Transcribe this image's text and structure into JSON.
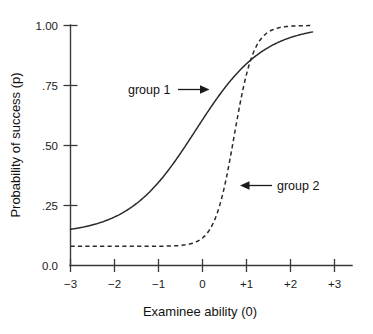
{
  "figure": {
    "width": 373,
    "height": 334,
    "background": "#ffffff",
    "ink_color": "#2a2a2a"
  },
  "chart_data": {
    "type": "line",
    "title": "",
    "subtitle": "",
    "xlabel": "Examinee ability (0)",
    "ylabel": "Probability of success (p)",
    "xlim": [
      -3.3,
      3.3
    ],
    "ylim": [
      0.0,
      1.0
    ],
    "xticks": [
      -3,
      -2,
      -1,
      0,
      1,
      2,
      3
    ],
    "xticklabels": [
      "−3",
      "−2",
      "−1",
      "0",
      "+1",
      "+2",
      "+3"
    ],
    "yticks": [
      0.0,
      0.25,
      0.5,
      0.75,
      1.0
    ],
    "yticklabels": [
      "0.0",
      ".25",
      ".50",
      ".75",
      "1.00"
    ],
    "grid": false,
    "legend": "none",
    "annotations": [
      {
        "text": "group 1",
        "series": "group 1",
        "arrow_direction": "right",
        "points_at_x": -0.05,
        "points_at_y": 0.73
      },
      {
        "text": "group 2",
        "series": "group 2",
        "arrow_direction": "left",
        "points_at_x": 0.7,
        "points_at_y": 0.37
      }
    ],
    "series": [
      {
        "name": "group 1",
        "style": "solid",
        "model": "3PL item characteristic curve",
        "guessing_c": 0.13,
        "difficulty_b": -0.15,
        "discrimination_a": 1.3,
        "x": [
          -3.0,
          -2.75,
          -2.5,
          -2.25,
          -2.0,
          -1.75,
          -1.5,
          -1.25,
          -1.0,
          -0.75,
          -0.5,
          -0.25,
          0.0,
          0.25,
          0.5,
          0.75,
          1.0,
          1.25,
          1.5,
          1.75,
          2.0,
          2.25,
          2.5
        ],
        "values": [
          0.13,
          0.14,
          0.15,
          0.16,
          0.18,
          0.2,
          0.23,
          0.27,
          0.32,
          0.39,
          0.47,
          0.56,
          0.64,
          0.72,
          0.79,
          0.85,
          0.89,
          0.92,
          0.94,
          0.95,
          0.96,
          0.97,
          0.97
        ]
      },
      {
        "name": "group 2",
        "style": "dashed",
        "model": "3PL item characteristic curve",
        "guessing_c": 0.08,
        "difficulty_b": 0.72,
        "discrimination_a": 4.5,
        "x": [
          -3.0,
          -2.75,
          -2.5,
          -2.25,
          -2.0,
          -1.75,
          -1.5,
          -1.25,
          -1.0,
          -0.75,
          -0.5,
          -0.25,
          0.0,
          0.25,
          0.5,
          0.75,
          1.0,
          1.25,
          1.5,
          1.75,
          2.0,
          2.25,
          2.5
        ],
        "values": [
          0.08,
          0.08,
          0.08,
          0.08,
          0.08,
          0.08,
          0.09,
          0.09,
          0.09,
          0.1,
          0.11,
          0.13,
          0.17,
          0.26,
          0.44,
          0.66,
          0.85,
          0.93,
          0.96,
          0.97,
          0.97,
          0.98,
          0.98
        ]
      }
    ]
  }
}
